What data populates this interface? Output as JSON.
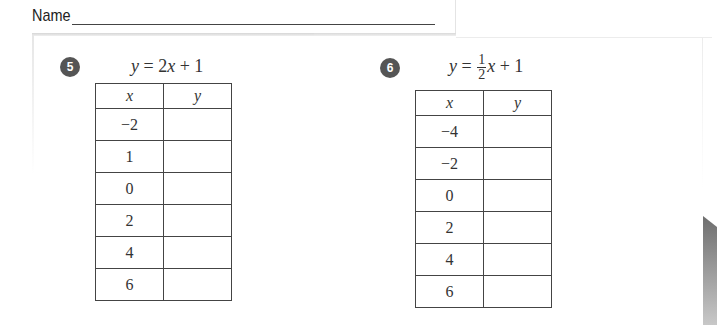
{
  "header": {
    "name_label": "Name"
  },
  "problems": [
    {
      "number": "5",
      "equation": {
        "lhs": "y",
        "coef_text": "2",
        "var": "x",
        "rest": "+ 1"
      },
      "table": {
        "headers": [
          "x",
          "y"
        ],
        "rows": [
          {
            "x": "−2",
            "y": ""
          },
          {
            "x": "1",
            "y": ""
          },
          {
            "x": "0",
            "y": ""
          },
          {
            "x": "2",
            "y": ""
          },
          {
            "x": "4",
            "y": ""
          },
          {
            "x": "6",
            "y": ""
          }
        ]
      }
    },
    {
      "number": "6",
      "equation": {
        "lhs": "y",
        "frac_num": "1",
        "frac_den": "2",
        "var": "x",
        "rest": "+ 1"
      },
      "table": {
        "headers": [
          "x",
          "y"
        ],
        "rows": [
          {
            "x": "−4",
            "y": ""
          },
          {
            "x": "−2",
            "y": ""
          },
          {
            "x": "0",
            "y": ""
          },
          {
            "x": "2",
            "y": ""
          },
          {
            "x": "4",
            "y": ""
          },
          {
            "x": "6",
            "y": ""
          }
        ]
      }
    }
  ]
}
